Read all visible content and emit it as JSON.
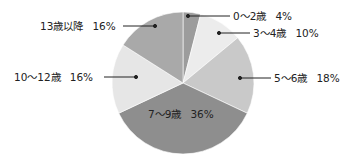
{
  "chart_data": {
    "type": "pie",
    "title": "",
    "categories": [
      "0〜2歳",
      "3〜4歳",
      "5〜6歳",
      "7〜9歳",
      "10〜12歳",
      "13歳以降"
    ],
    "values": [
      4,
      10,
      18,
      36,
      16,
      16
    ],
    "unit": "%",
    "colors": [
      "#9c9c9c",
      "#ececec",
      "#c9c9c9",
      "#8e8e8e",
      "#e6e6e6",
      "#a9a9a9"
    ],
    "start_angle": "12 o'clock",
    "direction": "clockwise",
    "legend": "none (leader-line labels)"
  },
  "labels": [
    {
      "name": "0〜2歳",
      "pct": "4%"
    },
    {
      "name": "3〜4歳",
      "pct": "10%"
    },
    {
      "name": "5〜6歳",
      "pct": "18%"
    },
    {
      "name": "7〜9歳",
      "pct": "36%"
    },
    {
      "name": "10〜12歳",
      "pct": "16%"
    },
    {
      "name": "13歳以降",
      "pct": "16%"
    }
  ]
}
